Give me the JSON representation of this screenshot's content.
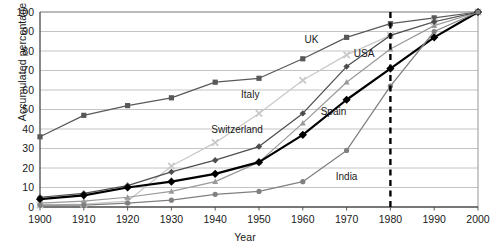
{
  "chart_data": {
    "type": "line",
    "title": "",
    "xlabel": "Year",
    "ylabel": "Accumulated percentage",
    "xlim": [
      1900,
      2000
    ],
    "ylim": [
      0,
      100
    ],
    "x": [
      1900,
      1910,
      1920,
      1930,
      1940,
      1950,
      1960,
      1970,
      1980,
      1990,
      2000
    ],
    "xticks": [
      "1900",
      "1910",
      "1920",
      "1930",
      "1940",
      "1950",
      "1960",
      "1970",
      "1980",
      "1990",
      "2000"
    ],
    "yticks": [
      "0",
      "10",
      "20",
      "30",
      "40",
      "50",
      "60",
      "70",
      "80",
      "90",
      "100"
    ],
    "grid": "horizontal",
    "legend": "inline-annotations",
    "series": [
      {
        "name": "UK",
        "color": "#595959",
        "marker": "square",
        "values": [
          36,
          47,
          52,
          56,
          64,
          66,
          76,
          87,
          94,
          97,
          100
        ]
      },
      {
        "name": "Italy",
        "color": "#c9c9c9",
        "marker": "x",
        "values": [
          1,
          1.5,
          3,
          21,
          33,
          48,
          65,
          78,
          88,
          95,
          100
        ]
      },
      {
        "name": "USA",
        "color": "#9a9a9a",
        "marker": "triangle",
        "values": [
          2,
          3,
          5,
          8,
          13,
          23,
          43,
          64,
          81,
          93,
          100
        ]
      },
      {
        "name": "Switzerland",
        "color": "#4d4d4d",
        "marker": "diamond",
        "values": [
          5,
          7,
          11,
          18,
          24,
          31,
          48,
          72,
          88,
          95,
          100
        ]
      },
      {
        "name": "Spain",
        "color": "#000000",
        "marker": "diamond-bold",
        "values": [
          4,
          6,
          10,
          13,
          17,
          23,
          37,
          55,
          71,
          87,
          100
        ]
      },
      {
        "name": "India",
        "color": "#808080",
        "marker": "circle",
        "values": [
          1,
          1,
          2,
          3.5,
          6.5,
          8,
          13,
          29,
          62,
          90,
          100
        ]
      }
    ],
    "reference_line": {
      "x": 1980,
      "style": "dashed",
      "color": "#000000"
    },
    "annotations": [
      {
        "text": "UK",
        "x": 1962,
        "y": 84
      },
      {
        "text": "Italy",
        "x": 1948,
        "y": 56
      },
      {
        "text": "USA",
        "x": 1974,
        "y": 77
      },
      {
        "text": "Switzerland",
        "x": 1945,
        "y": 38
      },
      {
        "text": "Spain",
        "x": 1967,
        "y": 47
      },
      {
        "text": "India",
        "x": 1970,
        "y": 14
      }
    ]
  }
}
